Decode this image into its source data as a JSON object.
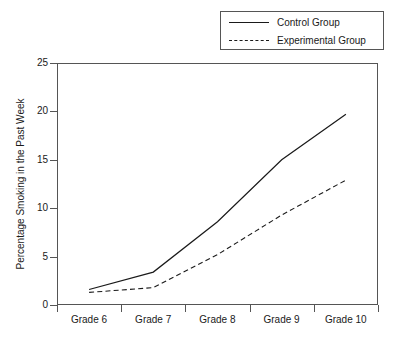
{
  "chart_data": {
    "type": "line",
    "title": "",
    "xlabel": "",
    "ylabel": "Percentage Smoking in the Past Week",
    "categories": [
      "Grade 6",
      "Grade 7",
      "Grade 8",
      "Grade 9",
      "Grade 10"
    ],
    "series": [
      {
        "name": "Control Group",
        "style": "solid",
        "values": [
          1.6,
          3.4,
          8.6,
          15.0,
          19.7
        ]
      },
      {
        "name": "Experimental Group",
        "style": "dashed",
        "values": [
          1.3,
          1.8,
          5.2,
          9.3,
          12.9
        ]
      }
    ],
    "ylim": [
      0,
      25
    ],
    "yticks": [
      0,
      5,
      10,
      15,
      20,
      25
    ],
    "ytick_labels": [
      "0",
      "5",
      "10",
      "15",
      "20",
      "25"
    ],
    "grid": false,
    "legend_position": "top-right",
    "legend_entries": [
      "Control Group",
      "Experimental Group"
    ],
    "colors": {
      "line": "#1a1a1a",
      "axis": "#555555",
      "background": "#ffffff"
    }
  }
}
